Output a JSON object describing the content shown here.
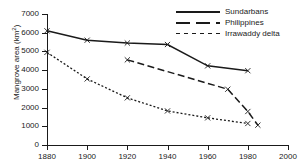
{
  "chart_data": {
    "type": "line",
    "title": "",
    "xlabel": "",
    "ylabel": "Mangrove area (km",
    "ylabel_sup": "2",
    "ylabel_close": ")",
    "xlim": [
      1880,
      2000
    ],
    "ylim": [
      0,
      7000
    ],
    "grid": false,
    "legend_position": "top-right",
    "xticks": [
      1880,
      1900,
      1920,
      1940,
      1960,
      1980,
      2000
    ],
    "yticks": [
      0,
      1000,
      2000,
      3000,
      4000,
      5000,
      6000,
      7000
    ],
    "marker": "x",
    "series": [
      {
        "name": "Sundarbans",
        "style": "solid",
        "x": [
          1880,
          1900,
          1920,
          1940,
          1960,
          1980
        ],
        "values": [
          6100,
          5600,
          5450,
          5370,
          4230,
          3970
        ]
      },
      {
        "name": "Philippines",
        "style": "dashed",
        "x": [
          1920,
          1970,
          1980,
          1985
        ],
        "values": [
          4550,
          2980,
          1790,
          1060
        ]
      },
      {
        "name": "Irrawaddy delta",
        "style": "dotted",
        "x": [
          1880,
          1900,
          1920,
          1940,
          1960,
          1980
        ],
        "values": [
          4950,
          3530,
          2520,
          1820,
          1450,
          1150
        ]
      }
    ]
  },
  "colors": {
    "ink": "#1a1a1a",
    "background": "#ffffff"
  }
}
